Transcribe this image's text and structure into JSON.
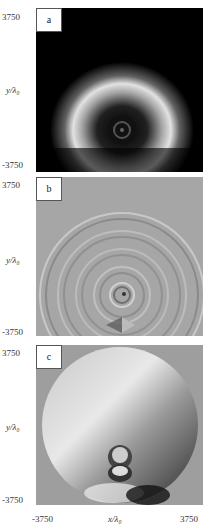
{
  "figure": {
    "panels": [
      {
        "label": "a",
        "y_top": "3750",
        "y_bottom": "-3750",
        "y_label": "y/λ₀",
        "description": "intensity: bright semicircular ring around dark central spot on black background"
      },
      {
        "label": "b",
        "y_top": "3750",
        "y_bottom": "-3750",
        "y_label": "y/λ₀",
        "description": "concentric fringes on gray background with vortex near bottom"
      },
      {
        "label": "c",
        "y_top": "3750",
        "y_bottom": "-3750",
        "y_label": "y/λ₀",
        "description": "phase map: circular disk with gradient and vortex pair near bottom center"
      }
    ],
    "x_axis": {
      "min": "-3750",
      "label": "x/λ₀",
      "max": "3750"
    }
  }
}
